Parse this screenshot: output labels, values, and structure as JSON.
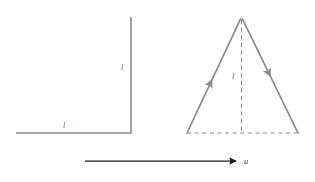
{
  "figure": {
    "background_color": "#ffffff",
    "stroke_color": "#8a8a8a",
    "dark_stroke_color": "#2b2b2b",
    "label_color": "#5a5a5a",
    "left_figure": {
      "name": "right-angle-rod-pair",
      "vertical_rod_label": "l",
      "horizontal_rod_label": "l",
      "vertical_rod": {
        "x1": 131,
        "y1": 17,
        "x2": 131,
        "y2": 133
      },
      "horizontal_rod": {
        "x1": 16,
        "y1": 133,
        "x2": 131,
        "y2": 133
      },
      "vertical_label_pos": {
        "x": 122,
        "y": 70
      },
      "horizontal_label_pos": {
        "x": 64,
        "y": 128
      }
    },
    "right_figure": {
      "name": "triangle-with-velocity-arrows",
      "height_label": "l",
      "apex": {
        "x": 241,
        "y": 18
      },
      "base_left": {
        "x": 187,
        "y": 133
      },
      "base_right": {
        "x": 298,
        "y": 133
      },
      "left_side_arrow_direction": "up-right",
      "right_side_arrow_direction": "down-right",
      "dashed_altitude": true,
      "dashed_base": true,
      "height_label_pos": {
        "x": 233,
        "y": 76
      }
    },
    "velocity_arrow": {
      "name": "velocity-vector-u",
      "label": "u",
      "x1": 85,
      "y1": 161,
      "x2": 239,
      "y2": 161,
      "label_pos": {
        "x": 244,
        "y": 164
      }
    }
  }
}
